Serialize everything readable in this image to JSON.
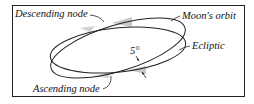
{
  "diagram": {
    "labels": {
      "descending_node": "Descending node",
      "moons_orbit": "Moon's orbit",
      "ecliptic": "Ecliptic",
      "inclination": "5°",
      "ascending_node": "Ascending node"
    },
    "colors": {
      "line": "#222222",
      "shade": "#c8c8c8",
      "background": "#ffffff"
    }
  }
}
